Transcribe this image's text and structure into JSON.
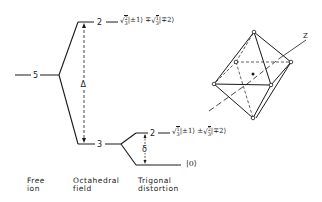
{
  "diagram": {
    "type": "energy-level-splitting",
    "colors": {
      "line": "#1a1a1a",
      "background": "#ffffff"
    },
    "levels": {
      "free_ion": {
        "degeneracy": "5"
      },
      "octahedral_upper": {
        "degeneracy": "2"
      },
      "octahedral_lower": {
        "degeneracy": "3"
      },
      "trigonal_upper": {
        "degeneracy": "2"
      }
    },
    "labels": {
      "delta_symbol": "Δ",
      "trigonal_splitting_symbol": "δ",
      "z_axis": "Z"
    },
    "equations": {
      "upper_eg": "√(2/3)|±1⟩ ∓ √(1/3)|∓2⟩",
      "trigonal_doublet": "√(1/3)|±1⟩ ± √(2/3)|∓2⟩",
      "trigonal_singlet": "|0⟩"
    },
    "eq_parts": {
      "upper": {
        "c1_num": "2",
        "c1_den": "3",
        "k1": "|±1⟩",
        "op": "∓",
        "c2_num": "1",
        "c2_den": "3",
        "k2": "|∓2⟩"
      },
      "doublet": {
        "c1_num": "1",
        "c1_den": "3",
        "k1": "|±1⟩",
        "op": "±",
        "c2_num": "2",
        "c2_den": "3",
        "k2": "|∓2⟩"
      },
      "singlet": "|0⟩"
    },
    "captions": {
      "free_ion": [
        "Free",
        "ion"
      ],
      "octahedral": [
        "Octahedral",
        "field"
      ],
      "trigonal": [
        "Trigonal",
        "distortion"
      ]
    }
  }
}
